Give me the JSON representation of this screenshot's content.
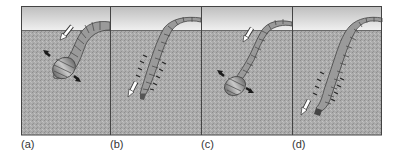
{
  "figure": {
    "panels": [
      {
        "label": "(a)",
        "phase": "head swells, anchoring; posterior pulled forward"
      },
      {
        "label": "(b)",
        "phase": "anterior segments elongate and push down into soil"
      },
      {
        "label": "(c)",
        "phase": "head swells again, anchoring"
      },
      {
        "label": "(d)",
        "phase": "anterior segments elongate and push deeper"
      }
    ],
    "colors": {
      "sky_top": "#bdbdbd",
      "sky_bottom": "#f2f2f2",
      "soil": "#a9a9a9",
      "frame": "#444444",
      "worm": "#8c8c8c",
      "worm_highlight": "#c8c8c8",
      "arrow_dark": "#1a1a1a"
    }
  }
}
